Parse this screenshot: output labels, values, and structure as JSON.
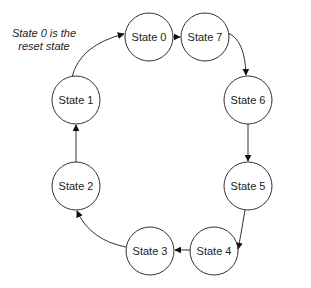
{
  "diagram": {
    "type": "state-machine",
    "annotation": {
      "lines": [
        "State 0 is the",
        "reset state"
      ]
    },
    "states": [
      {
        "id": "s0",
        "label": "State 0"
      },
      {
        "id": "s7",
        "label": "State 7"
      },
      {
        "id": "s6",
        "label": "State 6"
      },
      {
        "id": "s5",
        "label": "State 5"
      },
      {
        "id": "s4",
        "label": "State 4"
      },
      {
        "id": "s3",
        "label": "State 3"
      },
      {
        "id": "s2",
        "label": "State 2"
      },
      {
        "id": "s1",
        "label": "State 1"
      }
    ],
    "transitions": [
      {
        "from": "State 0",
        "to": "State 7"
      },
      {
        "from": "State 7",
        "to": "State 6"
      },
      {
        "from": "State 6",
        "to": "State 5"
      },
      {
        "from": "State 5",
        "to": "State 4"
      },
      {
        "from": "State 4",
        "to": "State 3"
      },
      {
        "from": "State 3",
        "to": "State 2"
      },
      {
        "from": "State 2",
        "to": "State 1"
      },
      {
        "from": "State 1",
        "to": "State 0"
      }
    ],
    "colors": {
      "stroke": "#333333",
      "fill": "#ffffff",
      "text": "#222222"
    }
  }
}
